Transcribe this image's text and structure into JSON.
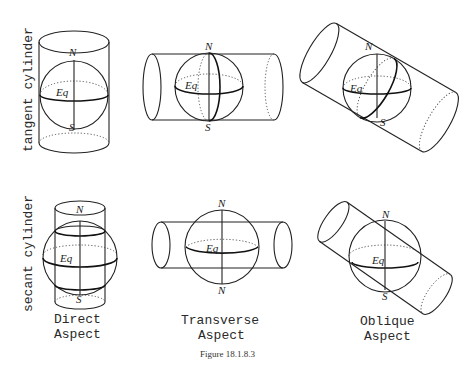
{
  "figure": {
    "caption": "Figure 18.1.8.3",
    "row_labels": {
      "tangent": "tangent cylinder",
      "secant": "secant cylinder"
    },
    "column_labels": {
      "direct": {
        "line1": "Direct",
        "line2": "Aspect"
      },
      "transverse": {
        "line1": "Transverse",
        "line2": "Aspect"
      },
      "oblique": {
        "line1": "Oblique",
        "line2": "Aspect"
      }
    },
    "panels": {
      "tangent_direct": {
        "north": "N",
        "south": "S",
        "equator": "Eq"
      },
      "tangent_transverse": {
        "north": "N",
        "south": "S",
        "equator": "Eq"
      },
      "tangent_oblique": {
        "north": "N",
        "south": "S",
        "equator": "Eq"
      },
      "secant_direct": {
        "north": "N",
        "south": "S",
        "equator": "Eq"
      },
      "secant_transverse": {
        "north": "N",
        "south": "N",
        "equator": "Eq"
      },
      "secant_oblique": {
        "north": "N",
        "south": "S",
        "equator": "Eq"
      }
    }
  }
}
